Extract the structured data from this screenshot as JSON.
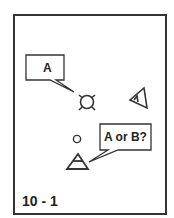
{
  "diagram": {
    "caption": "10 - 1",
    "callouts": [
      {
        "id": "callout-a",
        "text": "A"
      },
      {
        "id": "callout-a-or-b",
        "text": "A or B?"
      }
    ],
    "symbols": [
      {
        "id": "circle-with-legs",
        "description": "circle with four short legs"
      },
      {
        "id": "triangle-with-inner-triangle",
        "description": "triangle pointing left with small inner triangle"
      },
      {
        "id": "small-circle",
        "description": "small circle"
      },
      {
        "id": "triangle-upright",
        "description": "upright triangle with inner triangle"
      }
    ],
    "colors": {
      "stroke": "#333333",
      "background": "#ffffff"
    }
  }
}
